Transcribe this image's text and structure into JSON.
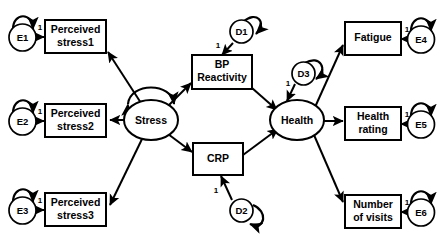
{
  "diagram": {
    "type": "structural-equation-model-path-diagram",
    "title": "",
    "background_color": "#ffffff",
    "line_color": "#000000",
    "fill_color": "#ffffff",
    "width": 443,
    "height": 244
  },
  "observed_variables": [
    {
      "id": "perceived-stress1",
      "label_line1": "Perceived",
      "label_line2": "stress1",
      "shape": "rectangle"
    },
    {
      "id": "perceived-stress2",
      "label_line1": "Perceived",
      "label_line2": "stress2",
      "shape": "rectangle"
    },
    {
      "id": "perceived-stress3",
      "label_line1": "Perceived",
      "label_line2": "stress3",
      "shape": "rectangle"
    },
    {
      "id": "bp-reactivity",
      "label_line1": "BP",
      "label_line2": "Reactivity",
      "shape": "rectangle"
    },
    {
      "id": "crp",
      "label_line1": "CRP",
      "label_line2": "",
      "shape": "rectangle"
    },
    {
      "id": "fatigue",
      "label_line1": "Fatigue",
      "label_line2": "",
      "shape": "rectangle"
    },
    {
      "id": "health-rating",
      "label_line1": "Health",
      "label_line2": "rating",
      "shape": "rectangle"
    },
    {
      "id": "number-of-visits",
      "label_line1": "Number",
      "label_line2": "of  visits",
      "shape": "rectangle"
    }
  ],
  "latent_variables": [
    {
      "id": "stress",
      "label": "Stress",
      "shape": "ellipse"
    },
    {
      "id": "health",
      "label": "Health",
      "shape": "ellipse"
    }
  ],
  "error_terms": [
    {
      "id": "e1",
      "label": "E1",
      "shape": "circle",
      "loading": "1"
    },
    {
      "id": "e2",
      "label": "E2",
      "shape": "circle",
      "loading": "1"
    },
    {
      "id": "e3",
      "label": "E3",
      "shape": "circle",
      "loading": "1"
    },
    {
      "id": "e4",
      "label": "E4",
      "shape": "circle",
      "loading": "1"
    },
    {
      "id": "e5",
      "label": "E5",
      "shape": "circle",
      "loading": "1"
    },
    {
      "id": "e6",
      "label": "E6",
      "shape": "circle",
      "loading": "1"
    }
  ],
  "disturbance_terms": [
    {
      "id": "d1",
      "label": "D1",
      "shape": "circle",
      "loading": "1"
    },
    {
      "id": "d2",
      "label": "D2",
      "shape": "circle",
      "loading": "1"
    },
    {
      "id": "d3",
      "label": "D3",
      "shape": "circle",
      "loading": "1"
    }
  ],
  "path_coefficients": {
    "e1_to_stress1": "1",
    "e2_to_stress2": "1",
    "e3_to_stress3": "1",
    "e4_to_fatigue": "1",
    "e5_to_health_rating": "1",
    "e6_to_visits": "1",
    "d1_to_bp_reactivity": "1",
    "d2_to_crp": "1",
    "d3_to_health": "1"
  },
  "directed_paths": [
    {
      "from": "e1",
      "to": "perceived-stress1",
      "label": "1"
    },
    {
      "from": "e2",
      "to": "perceived-stress2",
      "label": "1"
    },
    {
      "from": "e3",
      "to": "perceived-stress3",
      "label": "1"
    },
    {
      "from": "stress",
      "to": "perceived-stress1",
      "label": ""
    },
    {
      "from": "stress",
      "to": "perceived-stress2",
      "label": ""
    },
    {
      "from": "stress",
      "to": "perceived-stress3",
      "label": ""
    },
    {
      "from": "stress",
      "to": "bp-reactivity",
      "label": ""
    },
    {
      "from": "stress",
      "to": "crp",
      "label": ""
    },
    {
      "from": "d1",
      "to": "bp-reactivity",
      "label": "1"
    },
    {
      "from": "d2",
      "to": "crp",
      "label": "1"
    },
    {
      "from": "bp-reactivity",
      "to": "health",
      "label": ""
    },
    {
      "from": "crp",
      "to": "health",
      "label": ""
    },
    {
      "from": "d3",
      "to": "health",
      "label": "1"
    },
    {
      "from": "health",
      "to": "fatigue",
      "label": ""
    },
    {
      "from": "health",
      "to": "health-rating",
      "label": ""
    },
    {
      "from": "health",
      "to": "number-of-visits",
      "label": ""
    },
    {
      "from": "e4",
      "to": "fatigue",
      "label": "1"
    },
    {
      "from": "e5",
      "to": "health-rating",
      "label": "1"
    },
    {
      "from": "e6",
      "to": "number-of-visits",
      "label": "1"
    }
  ],
  "variance_loops": [
    {
      "on": "stress",
      "style": "double-headed-arc-above"
    },
    {
      "on": "e1",
      "style": "self-loop-above"
    },
    {
      "on": "e2",
      "style": "self-loop-above"
    },
    {
      "on": "e3",
      "style": "self-loop-above"
    },
    {
      "on": "e4",
      "style": "self-loop-above"
    },
    {
      "on": "e5",
      "style": "self-loop-above"
    },
    {
      "on": "e6",
      "style": "self-loop-above"
    },
    {
      "on": "d1",
      "style": "self-loop-right"
    },
    {
      "on": "d2",
      "style": "self-loop-right"
    },
    {
      "on": "d3",
      "style": "self-loop-right"
    }
  ]
}
